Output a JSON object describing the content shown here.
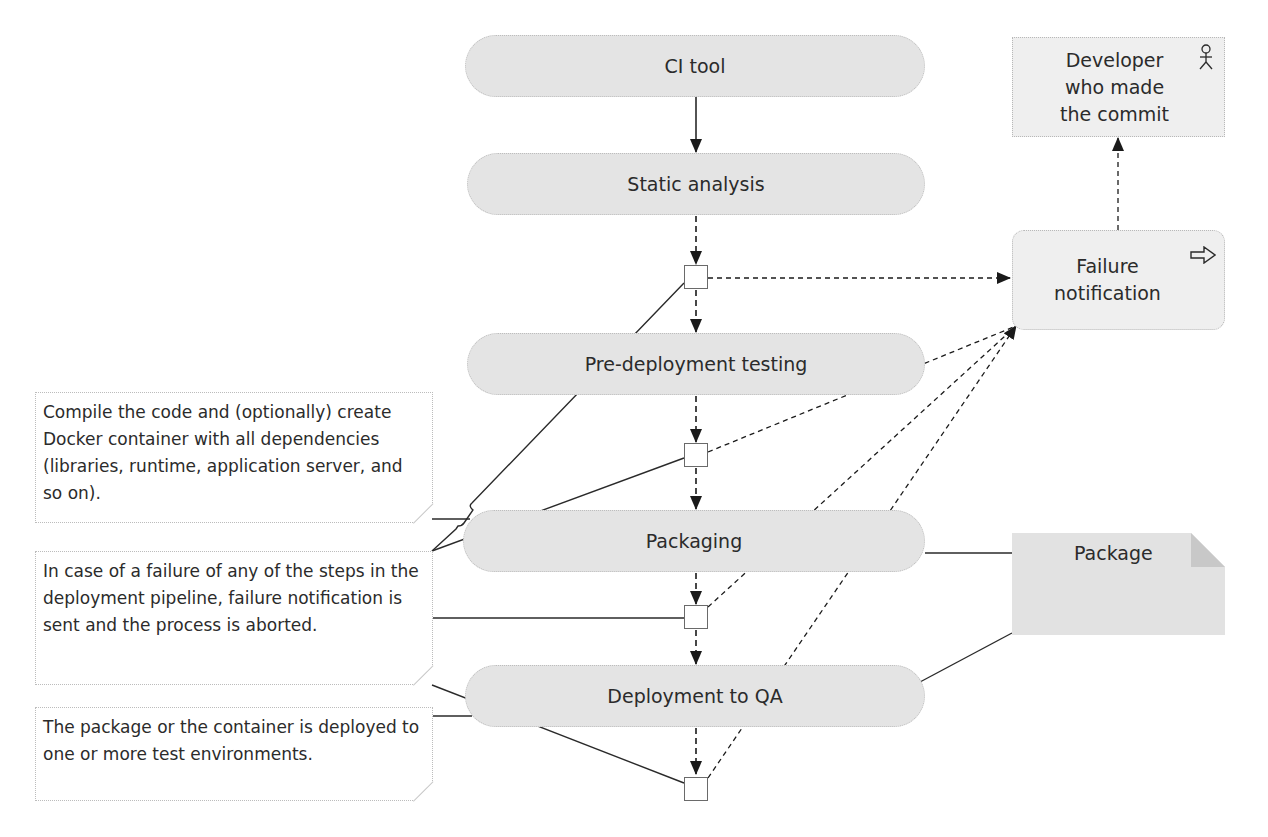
{
  "diagram": {
    "type": "deployment-pipeline-flow",
    "stages": [
      {
        "id": "ci_tool",
        "label": "CI tool"
      },
      {
        "id": "static_analysis",
        "label": "Static analysis"
      },
      {
        "id": "pre_deployment_testing",
        "label": "Pre-deployment testing"
      },
      {
        "id": "packaging",
        "label": "Packaging"
      },
      {
        "id": "deployment_to_qa",
        "label": "Deployment to QA"
      }
    ],
    "actors": {
      "developer": {
        "label_lines": [
          "Developer",
          "who made",
          "the commit"
        ],
        "icon": "actor-stick-figure-icon"
      },
      "failure_notification": {
        "label_lines": [
          "Failure",
          "notification"
        ],
        "icon": "outline-arrow-right-icon"
      }
    },
    "artifacts": {
      "package": {
        "label": "Package"
      }
    },
    "callouts": [
      {
        "id": "compile_note",
        "text": "Compile the code and (optionally) create Docker container with all dependencies (libraries, runtime, application server, and so on)."
      },
      {
        "id": "failure_note",
        "text": "In case of a failure of any of the steps in the deployment pipeline, failure notification is sent and the process is aborted."
      },
      {
        "id": "deploy_note",
        "text": "The package or the container is deployed to one or more test environments."
      }
    ],
    "edges": [
      {
        "from": "CI tool",
        "to": "Static analysis",
        "style": "solid-arrow"
      },
      {
        "from": "Static analysis",
        "to": "junction-1",
        "style": "dashed-arrow"
      },
      {
        "from": "junction-1",
        "to": "Pre-deployment testing",
        "style": "dashed-arrow"
      },
      {
        "from": "junction-1",
        "to": "Failure notification",
        "style": "dashed-arrow"
      },
      {
        "from": "Pre-deployment testing",
        "to": "junction-2",
        "style": "dashed-arrow"
      },
      {
        "from": "junction-2",
        "to": "Packaging",
        "style": "dashed-arrow"
      },
      {
        "from": "junction-2",
        "to": "Failure notification",
        "style": "dashed-arrow"
      },
      {
        "from": "Packaging",
        "to": "junction-3",
        "style": "dashed-arrow"
      },
      {
        "from": "junction-3",
        "to": "Deployment to QA",
        "style": "dashed-arrow"
      },
      {
        "from": "junction-3",
        "to": "Failure notification",
        "style": "dashed-arrow"
      },
      {
        "from": "Deployment to QA",
        "to": "junction-4",
        "style": "dashed-arrow"
      },
      {
        "from": "junction-4",
        "to": "Failure notification",
        "style": "dashed-arrow"
      },
      {
        "from": "Failure notification",
        "to": "Developer who made the commit",
        "style": "dashed-arrow"
      },
      {
        "from": "Packaging",
        "to": "Package",
        "style": "solid-line"
      },
      {
        "from": "Deployment to QA",
        "to": "Package",
        "style": "solid-line"
      }
    ]
  }
}
